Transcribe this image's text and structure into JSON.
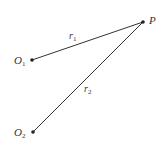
{
  "diagram": {
    "points": [
      {
        "id": "O1",
        "label": "O",
        "subscript": "1",
        "x": 32,
        "y": 60
      },
      {
        "id": "O2",
        "label": "O",
        "subscript": "2",
        "x": 33,
        "y": 132
      },
      {
        "id": "P",
        "label": "P",
        "subscript": "",
        "x": 143,
        "y": 22
      }
    ],
    "segments": [
      {
        "from": "O1",
        "to": "P",
        "label": "r",
        "subscript": "1"
      },
      {
        "from": "O2",
        "to": "P",
        "label": "r",
        "subscript": "2"
      }
    ],
    "colors": {
      "line": "#333333",
      "point": "#222222",
      "background": "#ffffff"
    }
  }
}
